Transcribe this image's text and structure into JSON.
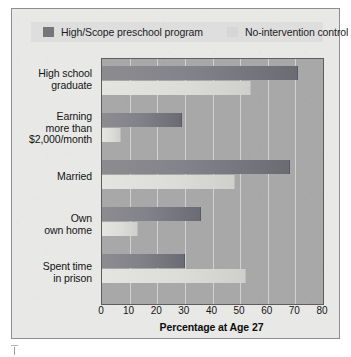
{
  "legend": {
    "entries": [
      {
        "label": "High/Scope preschool program",
        "swatch": "dark-gray-swatch-icon",
        "color": "#76767a"
      },
      {
        "label": "No-intervention control",
        "swatch": "light-gray-swatch-icon",
        "color": "#d6d6d4"
      }
    ]
  },
  "axis": {
    "x_title": "Percentage at Age 27",
    "ticks": [
      "0",
      "10",
      "20",
      "30",
      "40",
      "50",
      "60",
      "70",
      "80"
    ]
  },
  "categories": [
    {
      "line1": "High school",
      "line2": "graduate",
      "line3": ""
    },
    {
      "line1": "Earning",
      "line2": "more than",
      "line3": "$2,000/month"
    },
    {
      "line1": "Married",
      "line2": "",
      "line3": ""
    },
    {
      "line1": "Own",
      "line2": "own home",
      "line3": ""
    },
    {
      "line1": "Spent time",
      "line2": "in prison",
      "line3": ""
    }
  ],
  "chart_data": {
    "type": "bar",
    "orientation": "horizontal",
    "title": "",
    "xlabel": "Percentage at Age 27",
    "ylabel": "",
    "xlim": [
      0,
      80
    ],
    "xticks": [
      0,
      10,
      20,
      30,
      40,
      50,
      60,
      70,
      80
    ],
    "grid": true,
    "legend_position": "top",
    "categories": [
      "High school graduate",
      "Earning more than $2,000/month",
      "Married",
      "Own own home",
      "Spent time in prison"
    ],
    "series": [
      {
        "name": "High/Scope preschool program",
        "color": "#76767a",
        "values": [
          71,
          29,
          68,
          36,
          30
        ]
      },
      {
        "name": "No-intervention control",
        "color": "#d6d6d4",
        "values": [
          54,
          7,
          48,
          13,
          52
        ]
      }
    ]
  }
}
